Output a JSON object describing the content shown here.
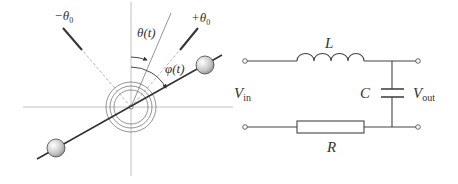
{
  "pendulum": {
    "labels": {
      "minus_theta0": "−θ",
      "minus_theta0_sub": "0",
      "plus_theta0": "+θ",
      "plus_theta0_sub": "0",
      "theta_t": "θ(t)",
      "phi_t": "φ(t)"
    },
    "colors": {
      "line": "#333333",
      "axis": "#aaaaaa",
      "ball": "#c8c8c8"
    }
  },
  "circuit": {
    "labels": {
      "inductor": "L",
      "capacitor": "C",
      "resistor": "R",
      "v_in": "V",
      "v_in_sub": "in",
      "v_out": "V",
      "v_out_sub": "out"
    },
    "components": [
      "inductor",
      "capacitor",
      "resistor"
    ]
  }
}
